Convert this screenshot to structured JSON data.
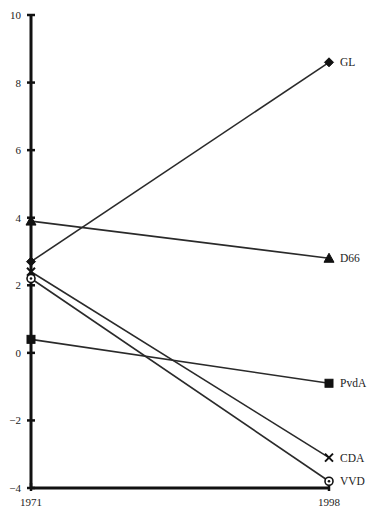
{
  "chart_data": {
    "type": "line",
    "title": "",
    "xlabel": "",
    "ylabel": "",
    "x": [
      "1971",
      "1998"
    ],
    "ylim": [
      -4,
      10
    ],
    "yticks": [
      10,
      8,
      6,
      4,
      2,
      0,
      -2,
      -4
    ],
    "ytick_labels": [
      "10",
      "8",
      "6",
      "4",
      "2",
      "0",
      "−2",
      "−4"
    ],
    "grid": false,
    "legend_position": "right-end labels",
    "series": [
      {
        "name": "GL",
        "marker": "diamond",
        "values": [
          2.7,
          8.6
        ]
      },
      {
        "name": "D66",
        "marker": "triangle",
        "values": [
          3.9,
          2.8
        ]
      },
      {
        "name": "PvdA",
        "marker": "square",
        "values": [
          0.4,
          -0.9
        ]
      },
      {
        "name": "CDA",
        "marker": "x",
        "values": [
          2.4,
          -3.1
        ]
      },
      {
        "name": "VVD",
        "marker": "circle",
        "values": [
          2.2,
          -3.8
        ]
      }
    ]
  }
}
